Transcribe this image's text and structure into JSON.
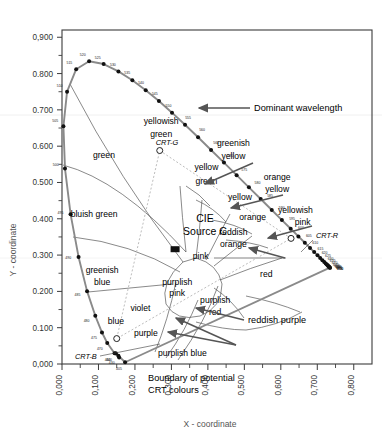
{
  "chart_data": {
    "type": "line",
    "xlabel": "X - coordinate",
    "ylabel": "Y - coordinate",
    "xlim": [
      0.0,
      0.85
    ],
    "ylim": [
      0.0,
      0.92
    ],
    "grid": false,
    "x_ticks": [
      "0,000",
      "0,100",
      "0,200",
      "0,300",
      "0,400",
      "0,500",
      "0,600",
      "0,700",
      "0,800"
    ],
    "x_tick_values": [
      0.0,
      0.1,
      0.2,
      0.3,
      0.4,
      0.5,
      0.6,
      0.7,
      0.8
    ],
    "y_ticks": [
      "0,000",
      "0.100",
      "0.200",
      "0.300",
      "0.400",
      "0.500",
      "0.600",
      "0.700",
      "0.800",
      "0,900"
    ],
    "y_tick_values": [
      0.0,
      0.1,
      0.2,
      0.3,
      0.4,
      0.5,
      0.6,
      0.7,
      0.8,
      0.9
    ],
    "spectral_locus": [
      {
        "wl": 405,
        "x": 0.173,
        "y": 0.0048
      },
      {
        "wl": 430,
        "x": 0.1547,
        "y": 0.0227
      },
      {
        "wl": 440,
        "x": 0.1476,
        "y": 0.0297
      },
      {
        "wl": 450,
        "x": 0.1566,
        "y": 0.0177
      },
      {
        "wl": 460,
        "x": 0.144,
        "y": 0.0297
      },
      {
        "wl": 470,
        "x": 0.1241,
        "y": 0.0578
      },
      {
        "wl": 475,
        "x": 0.1096,
        "y": 0.0868
      },
      {
        "wl": 480,
        "x": 0.0913,
        "y": 0.1327
      },
      {
        "wl": 485,
        "x": 0.0687,
        "y": 0.2007
      },
      {
        "wl": 490,
        "x": 0.0454,
        "y": 0.295
      },
      {
        "wl": 495,
        "x": 0.0235,
        "y": 0.4127
      },
      {
        "wl": 500,
        "x": 0.0082,
        "y": 0.5384
      },
      {
        "wl": 505,
        "x": 0.0039,
        "y": 0.6548
      },
      {
        "wl": 510,
        "x": 0.0139,
        "y": 0.7502
      },
      {
        "wl": 515,
        "x": 0.0389,
        "y": 0.812
      },
      {
        "wl": 520,
        "x": 0.0743,
        "y": 0.8338
      },
      {
        "wl": 525,
        "x": 0.1142,
        "y": 0.8262
      },
      {
        "wl": 530,
        "x": 0.1547,
        "y": 0.8059
      },
      {
        "wl": 535,
        "x": 0.1929,
        "y": 0.7816
      },
      {
        "wl": 540,
        "x": 0.2296,
        "y": 0.7543
      },
      {
        "wl": 545,
        "x": 0.2658,
        "y": 0.7243
      },
      {
        "wl": 550,
        "x": 0.3016,
        "y": 0.6923
      },
      {
        "wl": 555,
        "x": 0.3373,
        "y": 0.6589
      },
      {
        "wl": 560,
        "x": 0.3731,
        "y": 0.6245
      },
      {
        "wl": 565,
        "x": 0.4087,
        "y": 0.5896
      },
      {
        "wl": 570,
        "x": 0.4441,
        "y": 0.5547
      },
      {
        "wl": 575,
        "x": 0.4788,
        "y": 0.5202
      },
      {
        "wl": 580,
        "x": 0.5125,
        "y": 0.4866
      },
      {
        "wl": 585,
        "x": 0.5448,
        "y": 0.4544
      },
      {
        "wl": 590,
        "x": 0.5752,
        "y": 0.4242
      },
      {
        "wl": 595,
        "x": 0.6029,
        "y": 0.3965
      },
      {
        "wl": 600,
        "x": 0.627,
        "y": 0.3725
      },
      {
        "wl": 605,
        "x": 0.6482,
        "y": 0.3514
      },
      {
        "wl": 610,
        "x": 0.6658,
        "y": 0.334
      },
      {
        "wl": 615,
        "x": 0.6801,
        "y": 0.3197
      },
      {
        "wl": 620,
        "x": 0.6915,
        "y": 0.3083
      },
      {
        "wl": 625,
        "x": 0.7006,
        "y": 0.2993
      },
      {
        "wl": 630,
        "x": 0.7079,
        "y": 0.292
      },
      {
        "wl": 635,
        "x": 0.714,
        "y": 0.2859
      },
      {
        "wl": 640,
        "x": 0.719,
        "y": 0.2809
      },
      {
        "wl": 645,
        "x": 0.723,
        "y": 0.277
      },
      {
        "wl": 650,
        "x": 0.726,
        "y": 0.274
      },
      {
        "wl": 655,
        "x": 0.7283,
        "y": 0.2717
      },
      {
        "wl": 660,
        "x": 0.73,
        "y": 0.27
      },
      {
        "wl": 665,
        "x": 0.7311,
        "y": 0.2689
      },
      {
        "wl": 670,
        "x": 0.732,
        "y": 0.268
      },
      {
        "wl": 675,
        "x": 0.7327,
        "y": 0.2673
      },
      {
        "wl": 700,
        "x": 0.7347,
        "y": 0.2653
      },
      {
        "wl": 750,
        "x": 0.7347,
        "y": 0.2653
      }
    ],
    "labelled_wavelengths": [
      405,
      430,
      440,
      460,
      470,
      475,
      480,
      485,
      490,
      495,
      500,
      505,
      510,
      515,
      520,
      525,
      530,
      535,
      540,
      545,
      550,
      555,
      560,
      565,
      570,
      575,
      580,
      585,
      590,
      595,
      600,
      605,
      610,
      615,
      620,
      625,
      630,
      635,
      640,
      645,
      650,
      655,
      660,
      665,
      670,
      675,
      700,
      750
    ],
    "white_point": {
      "label_line1": "CIE",
      "label_line2": "Source C",
      "x": 0.3101,
      "y": 0.3162,
      "marker": "filled-square"
    },
    "crt_primaries": [
      {
        "name": "CRT-R",
        "x": 0.628,
        "y": 0.346,
        "marker": "open-circle"
      },
      {
        "name": "CRT-G",
        "x": 0.268,
        "y": 0.588,
        "marker": "open-circle"
      },
      {
        "name": "CRT-B",
        "x": 0.15,
        "y": 0.07,
        "marker": "open-circle"
      }
    ],
    "region_labels": [
      {
        "text": "green",
        "x": 0.115,
        "y": 0.568
      },
      {
        "text": "yellowish",
        "x": 0.272,
        "y": 0.662
      },
      {
        "text": "green",
        "x": 0.272,
        "y": 0.624
      },
      {
        "text": "yellow",
        "x": 0.396,
        "y": 0.534
      },
      {
        "text": "green",
        "x": 0.396,
        "y": 0.497
      },
      {
        "text": "yellow",
        "x": 0.488,
        "y": 0.452
      },
      {
        "text": "orange",
        "x": 0.523,
        "y": 0.398
      },
      {
        "text": "bluish green",
        "x": 0.088,
        "y": 0.405
      },
      {
        "text": "greenish",
        "x": 0.11,
        "y": 0.252
      },
      {
        "text": "blue",
        "x": 0.11,
        "y": 0.218
      },
      {
        "text": "blue",
        "x": 0.148,
        "y": 0.11
      },
      {
        "text": "violet",
        "x": 0.215,
        "y": 0.147
      },
      {
        "text": "purple",
        "x": 0.23,
        "y": 0.077
      },
      {
        "text": "purplish blue",
        "x": 0.33,
        "y": 0.022
      },
      {
        "text": "pink",
        "x": 0.38,
        "y": 0.29
      },
      {
        "text": "purplish",
        "x": 0.316,
        "y": 0.218
      },
      {
        "text": "pink",
        "x": 0.316,
        "y": 0.186
      },
      {
        "text": "purplish",
        "x": 0.42,
        "y": 0.168
      },
      {
        "text": "red",
        "x": 0.42,
        "y": 0.136
      },
      {
        "text": "red",
        "x": 0.56,
        "y": 0.24
      },
      {
        "text": "reddish",
        "x": 0.47,
        "y": 0.356
      },
      {
        "text": "orange",
        "x": 0.47,
        "y": 0.322
      },
      {
        "text": "greenish",
        "x": 0.47,
        "y": 0.6
      },
      {
        "text": "yellow",
        "x": 0.47,
        "y": 0.566
      },
      {
        "text": "orange",
        "x": 0.59,
        "y": 0.508
      },
      {
        "text": "yellow",
        "x": 0.59,
        "y": 0.474
      },
      {
        "text": "yellowish",
        "x": 0.64,
        "y": 0.416
      },
      {
        "text": "pink",
        "x": 0.66,
        "y": 0.382
      }
    ],
    "annotations": [
      {
        "text": "Dominant wavelength",
        "target_wl": 555
      },
      {
        "text": "reddish purple"
      },
      {
        "text": "Boundary of potential",
        "text2": "CRT colours"
      }
    ]
  },
  "chart": {
    "axis_y_title": "Y - coordinate",
    "axis_x_title": "X - coordinate",
    "source_line1": "CIE",
    "source_line2": "Source C",
    "anno_dominant": "Dominant wavelength",
    "anno_reddish_purple": "reddish purple",
    "anno_boundary_1": "Boundary of potential",
    "anno_boundary_2": "CRT colours",
    "crt_r": "CRT-R",
    "crt_g": "CRT-G",
    "crt_b": "CRT-B"
  },
  "colors": {
    "frame": "#3b3b3b",
    "locus": "#7a7a7a",
    "locus_dot": "#111111",
    "region_line": "#4a4a4a",
    "crt_boundary": "#b0b0b0",
    "crt_dotted": "#bdbdbd",
    "arrow": "#555555",
    "tick_text": "#333333",
    "axis_text": "#555555",
    "background": "#ffffff"
  }
}
